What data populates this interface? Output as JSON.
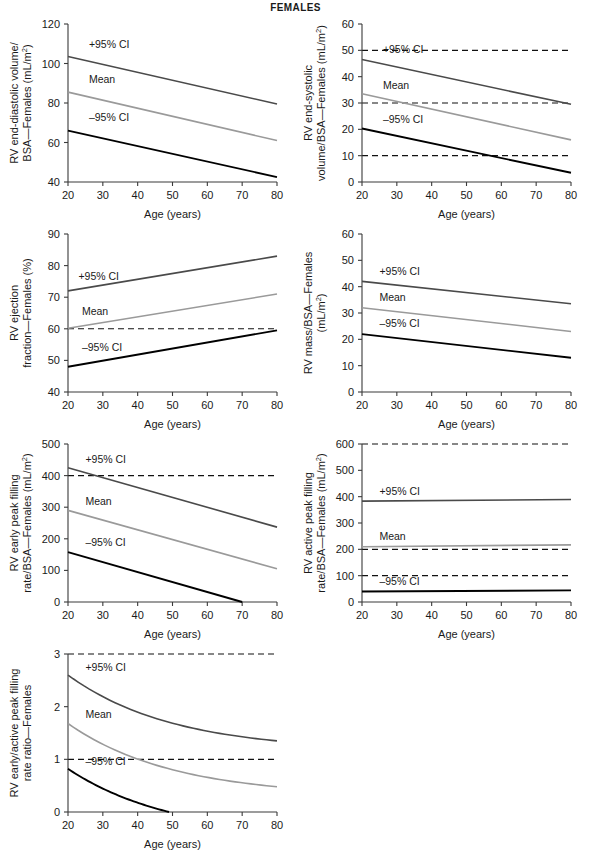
{
  "figure": {
    "title": "FEMALES",
    "xlabel": "Age (years)",
    "series_labels": {
      "upper": "+95% CI",
      "mean": "Mean",
      "lower": "–95% CI"
    },
    "colors": {
      "upper": "#4a4a4a",
      "mean": "#9a9a9a",
      "lower": "#000000",
      "refline": "#111111",
      "axis": "#3a3a3a"
    }
  },
  "chart_data": [
    {
      "id": "rv-end-diastolic-volume",
      "type": "line",
      "title": "",
      "ylabel_lines": [
        "RV end-diastolic volume/",
        "BSA—Females (mL/m²)"
      ],
      "xlabel": "Age (years)",
      "x": [
        20,
        80
      ],
      "xlim": [
        20,
        80
      ],
      "xticks": [
        20,
        30,
        40,
        50,
        60,
        70,
        80
      ],
      "ylim": [
        40,
        120
      ],
      "yticks": [
        40,
        60,
        80,
        100,
        120
      ],
      "grid": false,
      "reflines": [],
      "series": [
        {
          "name": "+95% CI",
          "values": [
            103.5,
            79.5
          ],
          "label_at": [
            26,
            108
          ]
        },
        {
          "name": "Mean",
          "values": [
            85.5,
            61.0
          ],
          "label_at": [
            26,
            90
          ]
        },
        {
          "name": "–95% CI",
          "values": [
            66.0,
            42.5
          ],
          "label_at": [
            26,
            71
          ]
        }
      ]
    },
    {
      "id": "rv-end-systolic-volume",
      "type": "line",
      "title": "",
      "ylabel_lines": [
        "RV end-systolic",
        "volume/BSA—Females (mL/m²)"
      ],
      "xlabel": "Age (years)",
      "x": [
        20,
        80
      ],
      "xlim": [
        20,
        80
      ],
      "xticks": [
        20,
        30,
        40,
        50,
        60,
        70,
        80
      ],
      "ylim": [
        0,
        60
      ],
      "yticks": [
        0,
        10,
        20,
        30,
        40,
        50,
        60
      ],
      "grid": false,
      "reflines": [
        50,
        30,
        10
      ],
      "series": [
        {
          "name": "+95% CI",
          "values": [
            46.5,
            29.5
          ],
          "label_at": [
            26,
            49
          ]
        },
        {
          "name": "Mean",
          "values": [
            33.5,
            16.0
          ],
          "label_at": [
            26,
            35.5
          ]
        },
        {
          "name": "–95% CI",
          "values": [
            20.3,
            3.5
          ],
          "label_at": [
            26,
            22.5
          ]
        }
      ]
    },
    {
      "id": "rv-ejection-fraction",
      "type": "line",
      "title": "",
      "ylabel_lines": [
        "RV ejection",
        "fraction—Females (%)"
      ],
      "xlabel": "Age (years)",
      "x": [
        20,
        80
      ],
      "xlim": [
        20,
        80
      ],
      "xticks": [
        20,
        30,
        40,
        50,
        60,
        70,
        80
      ],
      "ylim": [
        40,
        90
      ],
      "yticks": [
        40,
        50,
        60,
        70,
        80,
        90
      ],
      "grid": false,
      "reflines": [
        60
      ],
      "series": [
        {
          "name": "+95% CI",
          "values": [
            72.0,
            83.0
          ],
          "label_at": [
            23,
            75.5
          ]
        },
        {
          "name": "Mean",
          "values": [
            60.2,
            71.0
          ],
          "label_at": [
            24,
            64.5
          ]
        },
        {
          "name": "–95% CI",
          "values": [
            48.0,
            59.5
          ],
          "label_at": [
            24,
            53.0
          ]
        }
      ]
    },
    {
      "id": "rv-mass-bsa",
      "type": "line",
      "title": "",
      "ylabel_lines": [
        "RV mass/BSA—Females",
        "(mL/m²)"
      ],
      "xlabel": "Age (years)",
      "x": [
        20,
        80
      ],
      "xlim": [
        20,
        80
      ],
      "xticks": [
        20,
        30,
        40,
        50,
        60,
        70,
        80
      ],
      "ylim": [
        0,
        60
      ],
      "yticks": [
        0,
        10,
        20,
        30,
        40,
        50,
        60
      ],
      "grid": false,
      "reflines": [],
      "series": [
        {
          "name": "+95% CI",
          "values": [
            42.0,
            33.5
          ],
          "label_at": [
            25,
            44.5
          ]
        },
        {
          "name": "Mean",
          "values": [
            32.0,
            23.0
          ],
          "label_at": [
            25,
            34.5
          ]
        },
        {
          "name": "–95% CI",
          "values": [
            22.0,
            13.0
          ],
          "label_at": [
            25,
            24.5
          ]
        }
      ]
    },
    {
      "id": "rv-early-peak-filling-rate",
      "type": "line",
      "title": "",
      "ylabel_lines": [
        "RV early peak filling",
        "rate/BSA—Females (mL/m²)"
      ],
      "xlabel": "Age (years)",
      "x": [
        20,
        80
      ],
      "xlim": [
        20,
        80
      ],
      "xticks": [
        20,
        30,
        40,
        50,
        60,
        70,
        80
      ],
      "ylim": [
        0,
        500
      ],
      "yticks": [
        0,
        100,
        200,
        300,
        400,
        500
      ],
      "grid": false,
      "reflines": [
        400
      ],
      "series": [
        {
          "name": "+95% CI",
          "values": [
            425,
            237
          ],
          "label_at": [
            25,
            440
          ]
        },
        {
          "name": "Mean",
          "values": [
            290,
            105
          ],
          "label_at": [
            25,
            307
          ]
        },
        {
          "name": "–95% CI",
          "values": [
            158,
            0
          ],
          "x_end": 70,
          "label_at": [
            25,
            176
          ]
        }
      ]
    },
    {
      "id": "rv-active-peak-filling-rate",
      "type": "line",
      "title": "",
      "ylabel_lines": [
        "RV active peak filling",
        "rate/BSA—Females (mL/m²)"
      ],
      "xlabel": "Age (years)",
      "x": [
        20,
        80
      ],
      "xlim": [
        20,
        80
      ],
      "xticks": [
        20,
        30,
        40,
        50,
        60,
        70,
        80
      ],
      "ylim": [
        0,
        600
      ],
      "yticks": [
        0,
        100,
        200,
        300,
        400,
        500,
        600
      ],
      "grid": false,
      "reflines": [
        600,
        200,
        100
      ],
      "series": [
        {
          "name": "+95% CI",
          "values": [
            383,
            389
          ],
          "label_at": [
            25,
            408
          ]
        },
        {
          "name": "Mean",
          "values": [
            210,
            217
          ],
          "label_at": [
            25,
            237
          ]
        },
        {
          "name": "–95% CI",
          "values": [
            40,
            44
          ],
          "label_at": [
            25,
            66
          ]
        }
      ]
    },
    {
      "id": "rv-early-active-peak-filling-rate-ratio",
      "type": "line",
      "title": "",
      "ylabel_lines": [
        "RV early/active peak filling",
        "rate ratio—Females"
      ],
      "xlabel": "Age (years)",
      "x": [
        20,
        80
      ],
      "xlim": [
        20,
        80
      ],
      "xticks": [
        20,
        30,
        40,
        50,
        60,
        70,
        80
      ],
      "ylim": [
        0,
        3
      ],
      "yticks": [
        0,
        1,
        2,
        3
      ],
      "grid": false,
      "reflines": [
        3,
        1
      ],
      "curved": true,
      "series": [
        {
          "name": "+95% CI",
          "values": [
            2.6,
            1.35
          ],
          "label_at": [
            25,
            2.67
          ]
        },
        {
          "name": "Mean",
          "values": [
            1.68,
            0.48
          ],
          "label_at": [
            25,
            1.78
          ]
        },
        {
          "name": "–95% CI",
          "values": [
            0.82,
            0.0
          ],
          "x_end": 49,
          "label_at": [
            25,
            0.9
          ]
        }
      ]
    }
  ]
}
